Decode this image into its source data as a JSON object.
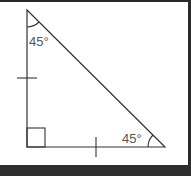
{
  "diagram": {
    "type": "right isosceles triangle",
    "vertices": {
      "top": [
        27,
        10
      ],
      "bottom_left": [
        27,
        147
      ],
      "bottom_right": [
        165,
        147
      ]
    },
    "labels": {
      "top_angle": "45°",
      "bottom_right_angle": "45°"
    },
    "marks": {
      "right_angle": "bottom_left",
      "equal_side_ticks": [
        "vertical_leg",
        "horizontal_leg"
      ]
    },
    "colors": {
      "stroke": "#333333",
      "label": "#555555",
      "frame": "#2a2a2a",
      "background": "#ffffff"
    }
  }
}
